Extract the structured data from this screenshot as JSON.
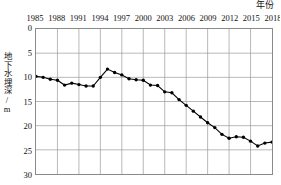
{
  "chart_data": {
    "type": "line",
    "title": "",
    "xlabel": "年份",
    "ylabel": "地下水埋深/m",
    "xlim": [
      1985,
      2018
    ],
    "ylim": [
      0,
      30
    ],
    "y_axis_inverted": true,
    "grid": true,
    "legend": "none",
    "xticks": [
      "1985",
      "1988",
      "1991",
      "1994",
      "1997",
      "2000",
      "2003",
      "2006",
      "2009",
      "2012",
      "2015",
      "2018"
    ],
    "yticks": [
      "0",
      "5",
      "10",
      "15",
      "20",
      "25",
      "30"
    ],
    "x": [
      1985,
      1986,
      1987,
      1988,
      1989,
      1990,
      1991,
      1992,
      1993,
      1994,
      1995,
      1996,
      1997,
      1998,
      1999,
      2000,
      2001,
      2002,
      2003,
      2004,
      2005,
      2006,
      2007,
      2008,
      2009,
      2010,
      2011,
      2012,
      2013,
      2014,
      2015,
      2016,
      2017,
      2018
    ],
    "values": [
      9.8,
      10.0,
      10.4,
      10.6,
      11.6,
      11.2,
      11.5,
      11.8,
      11.8,
      10.0,
      8.3,
      9.0,
      9.5,
      10.3,
      10.5,
      10.6,
      11.6,
      11.7,
      13.0,
      13.2,
      14.6,
      15.8,
      17.0,
      18.2,
      19.4,
      20.4,
      21.8,
      22.6,
      22.3,
      22.4,
      23.2,
      24.2,
      23.6,
      23.4
    ]
  },
  "axis": {
    "x_title": "年份",
    "y_title": "地下水埋深/m"
  }
}
